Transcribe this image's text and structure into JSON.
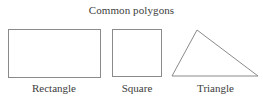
{
  "figure": {
    "title": "Common polygons",
    "background_color": "#ffffff",
    "stroke_color": "#8a8a8a",
    "text_color": "#3c3c3c",
    "shapes": [
      {
        "name": "rectangle",
        "label": "Rectangle",
        "type": "rectangle",
        "x": 8,
        "y": 29,
        "width": 92,
        "height": 48
      },
      {
        "name": "square",
        "label": "Square",
        "type": "rectangle",
        "x": 112,
        "y": 29,
        "width": 49,
        "height": 47
      },
      {
        "name": "triangle",
        "label": "Triangle",
        "type": "polygon",
        "points": "197,30 258,76 172,76"
      }
    ]
  }
}
